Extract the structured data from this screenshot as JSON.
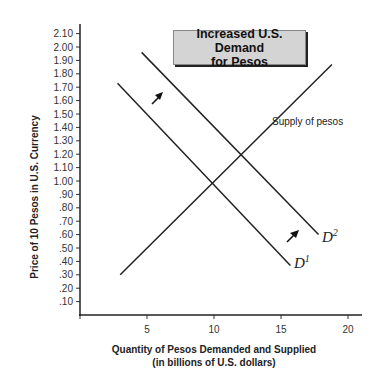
{
  "chart_data": {
    "type": "line",
    "title": "Increased U.S. Demand for Pesos",
    "xlabel": "Quantity of Pesos Demanded and Supplied",
    "xlabel_sub": "(in billions of U.S. dollars)",
    "ylabel": "Price of 10 Pesos in U.S. Currency",
    "xlim": [
      0,
      21
    ],
    "ylim": [
      0,
      2.1
    ],
    "x_ticks": [
      0,
      5,
      10,
      15,
      20
    ],
    "x_tick_labels": [
      "",
      "5",
      "10",
      "15",
      "20"
    ],
    "y_ticks": [
      0.1,
      0.2,
      0.3,
      0.4,
      0.5,
      0.6,
      0.7,
      0.8,
      0.9,
      1.0,
      1.1,
      1.2,
      1.3,
      1.4,
      1.5,
      1.6,
      1.7,
      1.8,
      1.9,
      2.0,
      2.1
    ],
    "y_tick_labels": [
      ".10",
      ".20",
      ".30",
      ".40",
      ".50",
      ".60",
      ".70",
      ".80",
      ".90",
      "1.00",
      "1.10",
      "1.20",
      "1.30",
      "1.40",
      "1.50",
      "1.60",
      "1.70",
      "1.80",
      "1.90",
      "2.00",
      "2.10"
    ],
    "grid": false,
    "series": [
      {
        "name": "Supply of pesos",
        "label": "Supply of pesos",
        "x": [
          3.0,
          18.8
        ],
        "y": [
          0.3,
          1.87
        ]
      },
      {
        "name": "D1",
        "label": "D",
        "label_sup": "1",
        "x": [
          2.8,
          15.7
        ],
        "y": [
          1.73,
          0.37
        ]
      },
      {
        "name": "D2",
        "label": "D",
        "label_sup": "2",
        "x": [
          4.6,
          17.8
        ],
        "y": [
          1.96,
          0.6
        ]
      }
    ],
    "equilibria": [
      {
        "name": "D1 ∩ Supply",
        "x": 10,
        "y": 1.0
      },
      {
        "name": "D2 ∩ Supply",
        "x": 12,
        "y": 1.2
      }
    ],
    "annotations": [
      {
        "type": "arrow",
        "direction": "up-right",
        "meaning": "demand shifts right from D1 to D2",
        "near": "upper"
      },
      {
        "type": "arrow",
        "direction": "up-right",
        "meaning": "demand shifts right from D1 to D2",
        "near": "lower"
      }
    ]
  },
  "title": {
    "line1": "Increased U.S. Demand",
    "line2": "for Pesos"
  },
  "labels": {
    "supply": "Supply of pesos",
    "d1_main": "D",
    "d1_sup": "1",
    "d2_main": "D",
    "d2_sup": "2",
    "xlabel_line1": "Quantity of Pesos Demanded and Supplied",
    "xlabel_line2": "(in billions of U.S. dollars)",
    "ylabel": "Price of 10 Pesos in U.S. Currency"
  },
  "colors": {
    "line": "#222222",
    "title_box_fill": "#d4d4d4",
    "title_box_shadow": "#222222"
  }
}
